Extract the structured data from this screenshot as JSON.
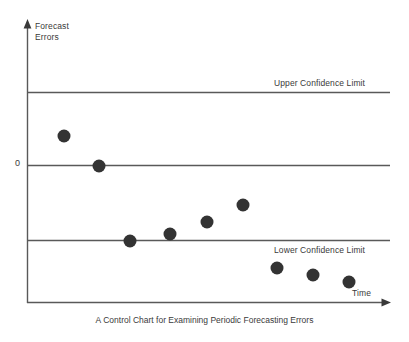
{
  "chart_data": {
    "type": "scatter",
    "title": "A Control Chart for Examining Periodic Forecasting Errors",
    "xlabel": "Time",
    "ylabel": "Forecast\nErrors",
    "ylabel_line1": "Forecast",
    "ylabel_line2": "Errors",
    "grid": false,
    "legend": "none",
    "x": [
      1,
      2,
      3,
      4,
      5,
      6,
      7,
      8,
      9
    ],
    "values": [
      0.55,
      0.0,
      -1.0,
      -0.9,
      -0.64,
      -0.32,
      -0.82,
      -0.94,
      -1.07
    ],
    "y_reference_lines": [
      {
        "name": "upper-confidence-limit",
        "label": "Upper Confidence Limit",
        "value": 1.0
      },
      {
        "name": "zero-line",
        "label": "0",
        "value": 0.0
      },
      {
        "name": "lower-confidence-limit",
        "label": "Lower Confidence Limit",
        "value": -1.0
      }
    ],
    "point_pixels": [
      {
        "x": 64,
        "y": 136
      },
      {
        "x": 99,
        "y": 166
      },
      {
        "x": 130,
        "y": 241
      },
      {
        "x": 170,
        "y": 234
      },
      {
        "x": 207,
        "y": 222
      },
      {
        "x": 243,
        "y": 205
      },
      {
        "x": 277,
        "y": 268
      },
      {
        "x": 313,
        "y": 275
      },
      {
        "x": 349,
        "y": 282
      }
    ],
    "marker_color": "#333333",
    "marker_radius": 6.5,
    "axis_color": "#595959",
    "line_color": "#595959",
    "text_color": "#3a3a3a"
  },
  "axes": {
    "y_label_line1": "Forecast",
    "y_label_line2": "Errors",
    "x_label": "Time",
    "zero_tick": "0"
  },
  "limits": {
    "upper_label": "Upper Confidence Limit",
    "lower_label": "Lower Confidence Limit"
  },
  "caption": {
    "text": "A Control Chart for Examining Periodic Forecasting Errors"
  }
}
